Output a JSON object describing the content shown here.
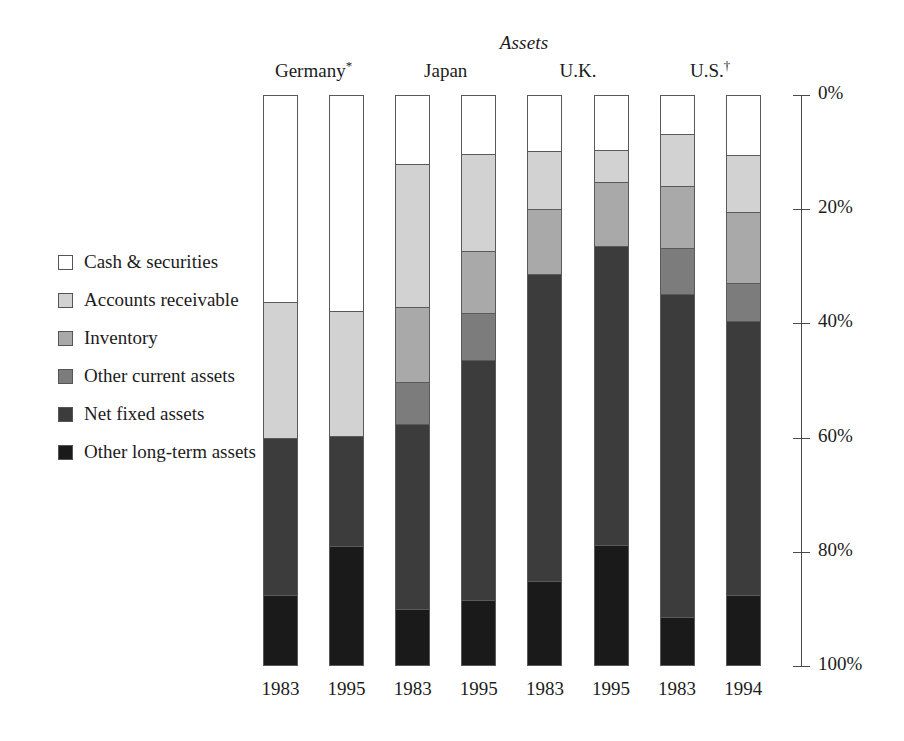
{
  "chart_data": {
    "type": "bar",
    "subtype": "stacked-bar-100-percent",
    "title": "Assets",
    "xlabel": "",
    "ylabel": "",
    "ylim": [
      0,
      100
    ],
    "y_axis_inverted": true,
    "y_tick_labels": [
      "0%",
      "20%",
      "40%",
      "60%",
      "80%",
      "100%"
    ],
    "y_ticks": [
      0,
      20,
      40,
      60,
      80,
      100
    ],
    "grid": false,
    "legend_position": "left",
    "categories": [
      "1983",
      "1995",
      "1983",
      "1995",
      "1983",
      "1995",
      "1983",
      "1994"
    ],
    "groups": [
      {
        "label": "Germany",
        "marker": "*",
        "columns": [
          0,
          1
        ]
      },
      {
        "label": "Japan",
        "marker": "",
        "columns": [
          2,
          3
        ]
      },
      {
        "label": "U.K.",
        "marker": "",
        "columns": [
          4,
          5
        ]
      },
      {
        "label": "U.S.",
        "marker": "†",
        "columns": [
          6,
          7
        ]
      }
    ],
    "series": [
      {
        "name": "Cash & securities",
        "color": "#ffffff",
        "values": [
          36.3,
          37.9,
          12.0,
          10.3,
          9.8,
          9.6,
          6.8,
          10.5
        ]
      },
      {
        "name": "Accounts receivable",
        "color": "#d2d2d2",
        "values": [
          23.7,
          21.8,
          25.1,
          17.0,
          10.2,
          5.6,
          9.1,
          10.0
        ]
      },
      {
        "name": "Inventory",
        "color": "#a9a9a9",
        "values": [
          0.0,
          0.0,
          13.2,
          10.9,
          11.4,
          11.2,
          10.9,
          12.5
        ]
      },
      {
        "name": "Other current assets",
        "color": "#7c7c7c",
        "values": [
          0.0,
          0.0,
          7.3,
          8.2,
          0.0,
          0.0,
          8.0,
          6.5
        ]
      },
      {
        "name": "Net fixed assets",
        "color": "#3c3c3c",
        "values": [
          27.5,
          19.2,
          32.4,
          42.1,
          53.8,
          52.4,
          56.7,
          48.0
        ]
      },
      {
        "name": "Other long-term assets",
        "color": "#1a1a1a",
        "values": [
          12.5,
          21.1,
          10.0,
          11.5,
          14.8,
          21.2,
          8.5,
          12.5
        ]
      }
    ]
  },
  "legend": {
    "items": [
      {
        "label": "Cash & securities",
        "color": "#ffffff"
      },
      {
        "label": "Accounts receivable",
        "color": "#d2d2d2"
      },
      {
        "label": "Inventory",
        "color": "#a9a9a9"
      },
      {
        "label": "Other current assets",
        "color": "#7c7c7c"
      },
      {
        "label": "Net fixed assets",
        "color": "#3c3c3c"
      },
      {
        "label": "Other long-term assets",
        "color": "#1a1a1a"
      }
    ]
  }
}
